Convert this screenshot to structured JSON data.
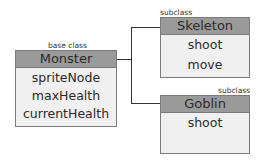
{
  "diagram": {
    "base": {
      "caption": "base class",
      "name": "Monster",
      "members": [
        "spriteNode",
        "maxHealth",
        "currentHealth"
      ]
    },
    "subclasses": [
      {
        "caption": "subclass",
        "name": "Skeleton",
        "members": [
          "shoot",
          "move"
        ]
      },
      {
        "caption": "subclass",
        "name": "Goblin",
        "members": [
          "shoot"
        ]
      }
    ],
    "colors": {
      "header": "#9a9a9a",
      "body": "#f0f0f0",
      "border": "#7a7a7a",
      "line": "#333333"
    }
  }
}
